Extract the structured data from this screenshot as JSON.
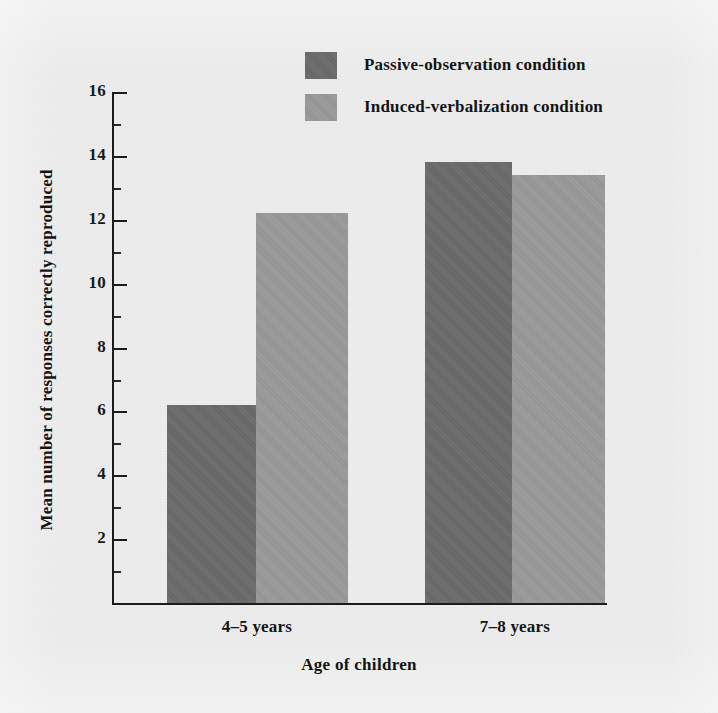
{
  "chart_data": {
    "type": "bar",
    "title": "",
    "xlabel": "Age of children",
    "ylabel": "Mean number of responses correctly reproduced",
    "categories": [
      "4–5 years",
      "7–8 years"
    ],
    "series": [
      {
        "name": "Passive-observation condition",
        "values": [
          6.2,
          13.8
        ],
        "color": "#6a6a6a"
      },
      {
        "name": "Induced-verbalization condition",
        "values": [
          12.2,
          13.4
        ],
        "color": "#9a9a9a"
      }
    ],
    "ylim": [
      0,
      16
    ],
    "yticks": [
      16,
      14,
      12,
      10,
      8,
      6,
      4,
      2
    ],
    "ytick_labels": [
      "16",
      "14",
      "12",
      "10",
      "8",
      "6",
      "4",
      "2"
    ],
    "minor_ytick_step": 1,
    "grid": false,
    "legend_position": "top-center",
    "background_color": "#ececec"
  },
  "axes": {
    "y_title": "Mean number of responses correctly reproduced",
    "x_title": "Age of children",
    "y_labels": {
      "t16": "16",
      "t14": "14",
      "t12": "12",
      "t10": "10",
      "t8": "8",
      "t6": "6",
      "t4": "4",
      "t2": "2"
    },
    "x_labels": {
      "g1": "4–5 years",
      "g2": "7–8 years"
    }
  },
  "legend": {
    "items": [
      {
        "label": "Passive-observation condition",
        "swatch": "dark-gray-swatch"
      },
      {
        "label": "Induced-verbalization condition",
        "swatch": "light-gray-swatch"
      }
    ]
  }
}
